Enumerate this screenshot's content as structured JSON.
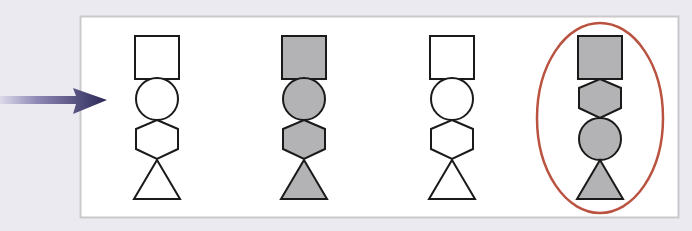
{
  "diagram": {
    "colors": {
      "background": "#eceaf1",
      "panel_fill": "#ffffff",
      "panel_border": "#c9c9cc",
      "stroke": "#1a1a1a",
      "shape_fill_gray": "#b3b3b5",
      "shape_fill_white": "#ffffff",
      "arrow_dark": "#2b2757",
      "arrow_light": "#d8d6e8",
      "highlight_ellipse": "#b9523f"
    },
    "arrow": {
      "icon": "right-arrow-icon",
      "points_to": "panel"
    },
    "figures": [
      {
        "id": 1,
        "fill": "white",
        "order": [
          "square",
          "circle",
          "hexagon",
          "triangle"
        ],
        "highlighted": false
      },
      {
        "id": 2,
        "fill": "gray",
        "order": [
          "square",
          "circle",
          "hexagon",
          "triangle"
        ],
        "highlighted": false
      },
      {
        "id": 3,
        "fill": "white",
        "order": [
          "square",
          "circle",
          "hexagon",
          "triangle"
        ],
        "highlighted": false
      },
      {
        "id": 4,
        "fill": "gray",
        "order": [
          "square",
          "hexagon",
          "circle",
          "triangle"
        ],
        "highlighted": true
      }
    ]
  }
}
